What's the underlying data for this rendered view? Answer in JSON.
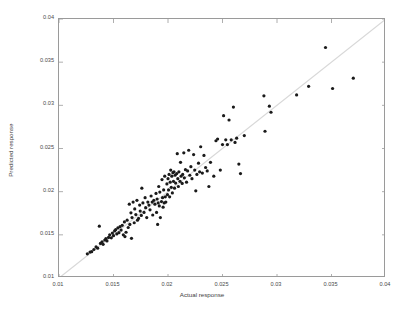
{
  "chart_data": {
    "type": "scatter",
    "title": "",
    "xlabel": "Actual response",
    "ylabel": "Predicted response",
    "xlim": [
      0.01,
      0.04
    ],
    "ylim": [
      0.01,
      0.04
    ],
    "xticks": [
      "0.01",
      "0.015",
      "0.02",
      "0.025",
      "0.03",
      "0.035",
      "0.04"
    ],
    "yticks": [
      "0.01",
      "0.015",
      "0.02",
      "0.025",
      "0.03",
      "0.035",
      "0.04"
    ],
    "xtick_values": [
      0.01,
      0.015,
      0.02,
      0.025,
      0.03,
      0.035,
      0.04
    ],
    "ytick_values": [
      0.01,
      0.015,
      0.02,
      0.025,
      0.03,
      0.035,
      0.04
    ],
    "grid": false,
    "legend": null,
    "marker": "dot",
    "marker_color": "#1a1a1a",
    "marker_size": 1.6,
    "reference_line": {
      "name": "identity-line",
      "from": [
        0.01,
        0.01
      ],
      "to": [
        0.04,
        0.04
      ],
      "color": "#d8d8d8",
      "width": 1.2
    },
    "frame_color": "#9a9a9a",
    "background": "#ffffff",
    "series": [
      {
        "name": "predicted-vs-actual",
        "points": [
          [
            0.0126,
            0.0128
          ],
          [
            0.01285,
            0.013
          ],
          [
            0.013,
            0.01305
          ],
          [
            0.0132,
            0.0133
          ],
          [
            0.0134,
            0.0136
          ],
          [
            0.01355,
            0.01345
          ],
          [
            0.0137,
            0.016
          ],
          [
            0.0138,
            0.014
          ],
          [
            0.01395,
            0.0142
          ],
          [
            0.01405,
            0.0139
          ],
          [
            0.0142,
            0.0144
          ],
          [
            0.0143,
            0.01455
          ],
          [
            0.0144,
            0.0143
          ],
          [
            0.01455,
            0.0147
          ],
          [
            0.01465,
            0.015
          ],
          [
            0.0148,
            0.01465
          ],
          [
            0.0149,
            0.0152
          ],
          [
            0.015,
            0.0149
          ],
          [
            0.0151,
            0.01545
          ],
          [
            0.0152,
            0.0156
          ],
          [
            0.0153,
            0.0151
          ],
          [
            0.0154,
            0.0158
          ],
          [
            0.0155,
            0.01525
          ],
          [
            0.0156,
            0.01595
          ],
          [
            0.0157,
            0.01555
          ],
          [
            0.0158,
            0.0161
          ],
          [
            0.0159,
            0.015
          ],
          [
            0.016,
            0.0165
          ],
          [
            0.01605,
            0.0148
          ],
          [
            0.01615,
            0.0153
          ],
          [
            0.01625,
            0.0167
          ],
          [
            0.01635,
            0.01585
          ],
          [
            0.01645,
            0.01855
          ],
          [
            0.0165,
            0.0162
          ],
          [
            0.0166,
            0.01755
          ],
          [
            0.01665,
            0.0146
          ],
          [
            0.0167,
            0.017
          ],
          [
            0.0168,
            0.0188
          ],
          [
            0.0169,
            0.0164
          ],
          [
            0.01695,
            0.018
          ],
          [
            0.01705,
            0.01735
          ],
          [
            0.01715,
            0.019
          ],
          [
            0.0172,
            0.0167
          ],
          [
            0.0173,
            0.0169
          ],
          [
            0.0174,
            0.01845
          ],
          [
            0.01745,
            0.01775
          ],
          [
            0.01755,
            0.01725
          ],
          [
            0.0176,
            0.0204
          ],
          [
            0.0177,
            0.0187
          ],
          [
            0.0178,
            0.0176
          ],
          [
            0.0179,
            0.0193
          ],
          [
            0.01795,
            0.01815
          ],
          [
            0.01805,
            0.017
          ],
          [
            0.01815,
            0.0188
          ],
          [
            0.01825,
            0.01845
          ],
          [
            0.01835,
            0.0179
          ],
          [
            0.01845,
            0.0195
          ],
          [
            0.01855,
            0.0188
          ],
          [
            0.0186,
            0.0173
          ],
          [
            0.0187,
            0.019
          ],
          [
            0.0188,
            0.01855
          ],
          [
            0.0189,
            0.0198
          ],
          [
            0.01895,
            0.0176
          ],
          [
            0.019,
            0.01915
          ],
          [
            0.01905,
            0.0162
          ],
          [
            0.0191,
            0.0187
          ],
          [
            0.01915,
            0.0206
          ],
          [
            0.0192,
            0.01835
          ],
          [
            0.01925,
            0.01995
          ],
          [
            0.0193,
            0.017
          ],
          [
            0.0194,
            0.01885
          ],
          [
            0.01945,
            0.0214
          ],
          [
            0.0195,
            0.0193
          ],
          [
            0.01955,
            0.0182
          ],
          [
            0.0196,
            0.0202
          ],
          [
            0.01965,
            0.0187
          ],
          [
            0.0197,
            0.0218
          ],
          [
            0.01975,
            0.0194
          ],
          [
            0.0198,
            0.0188
          ],
          [
            0.0199,
            0.0209
          ],
          [
            0.01995,
            0.01965
          ],
          [
            0.02,
            0.0215
          ],
          [
            0.02005,
            0.0202
          ],
          [
            0.0201,
            0.022
          ],
          [
            0.02015,
            0.0194
          ],
          [
            0.0202,
            0.0211
          ],
          [
            0.02025,
            0.0225
          ],
          [
            0.0203,
            0.0205
          ],
          [
            0.02035,
            0.0218
          ],
          [
            0.0204,
            0.01985
          ],
          [
            0.02045,
            0.0222
          ],
          [
            0.0205,
            0.0212
          ],
          [
            0.02055,
            0.0223
          ],
          [
            0.0206,
            0.0204
          ],
          [
            0.02065,
            0.0219
          ],
          [
            0.0207,
            0.021
          ],
          [
            0.0208,
            0.0221
          ],
          [
            0.02085,
            0.0244
          ],
          [
            0.0209,
            0.0215
          ],
          [
            0.02095,
            0.0206
          ],
          [
            0.021,
            0.0223
          ],
          [
            0.0211,
            0.0212
          ],
          [
            0.02115,
            0.0234
          ],
          [
            0.0212,
            0.0218
          ],
          [
            0.0213,
            0.02095
          ],
          [
            0.02135,
            0.022
          ],
          [
            0.02145,
            0.0245
          ],
          [
            0.0215,
            0.0216
          ],
          [
            0.0216,
            0.02255
          ],
          [
            0.0217,
            0.0211
          ],
          [
            0.0218,
            0.0224
          ],
          [
            0.0219,
            0.0248
          ],
          [
            0.022,
            0.0219
          ],
          [
            0.0221,
            0.0229
          ],
          [
            0.0222,
            0.0215
          ],
          [
            0.02235,
            0.0243
          ],
          [
            0.02245,
            0.0225
          ],
          [
            0.02255,
            0.0201
          ],
          [
            0.02265,
            0.022
          ],
          [
            0.0228,
            0.0233
          ],
          [
            0.0229,
            0.0223
          ],
          [
            0.023,
            0.0252
          ],
          [
            0.02315,
            0.02215
          ],
          [
            0.0233,
            0.0242
          ],
          [
            0.02345,
            0.0228
          ],
          [
            0.0236,
            0.0224
          ],
          [
            0.02375,
            0.0206
          ],
          [
            0.0239,
            0.0234
          ],
          [
            0.0242,
            0.0218
          ],
          [
            0.0244,
            0.0259
          ],
          [
            0.02455,
            0.0261
          ],
          [
            0.0248,
            0.0225
          ],
          [
            0.025,
            0.02545
          ],
          [
            0.0251,
            0.0288
          ],
          [
            0.0253,
            0.026
          ],
          [
            0.02545,
            0.02545
          ],
          [
            0.0256,
            0.0283
          ],
          [
            0.0258,
            0.026
          ],
          [
            0.026,
            0.0298
          ],
          [
            0.02615,
            0.0257
          ],
          [
            0.0263,
            0.0262
          ],
          [
            0.0265,
            0.0232
          ],
          [
            0.02665,
            0.0221
          ],
          [
            0.027,
            0.0265
          ],
          [
            0.0288,
            0.0311
          ],
          [
            0.0289,
            0.027
          ],
          [
            0.0293,
            0.0299
          ],
          [
            0.02945,
            0.0292
          ],
          [
            0.0318,
            0.0312
          ],
          [
            0.0329,
            0.0322
          ],
          [
            0.03445,
            0.0367
          ],
          [
            0.0351,
            0.03195
          ],
          [
            0.037,
            0.03315
          ]
        ]
      }
    ]
  },
  "axes": {
    "xlabel": "Actual response",
    "ylabel": "Predicted response"
  }
}
